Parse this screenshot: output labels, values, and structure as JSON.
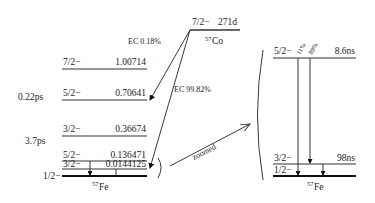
{
  "parent": {
    "spin": "7/2−",
    "halflife": "271d",
    "nucleus_mass": "57",
    "nucleus_symbol": "Co"
  },
  "decays": [
    {
      "label": "EC 0.18%",
      "to_level": "0.70641"
    },
    {
      "label": "EC 99.82%",
      "to_level": "0.136471"
    }
  ],
  "left_levels": [
    {
      "spin": "7/2−",
      "energy": "1.00714",
      "lifetime": ""
    },
    {
      "spin": "5/2−",
      "energy": "0.70641",
      "lifetime": "0.22ps"
    },
    {
      "spin": "3/2−",
      "energy": "0.36674",
      "lifetime": "3.7ps"
    },
    {
      "spin": "5/2−",
      "energy": "0.136471",
      "lifetime": ""
    },
    {
      "spin": "3/2−",
      "energy": "0.0144125",
      "lifetime": ""
    },
    {
      "spin": "1/2−",
      "energy": "",
      "lifetime": ""
    }
  ],
  "left_daughter": {
    "nucleus_mass": "57",
    "nucleus_symbol": "Fe"
  },
  "zoom_label": "zoomed",
  "right_levels": [
    {
      "spin": "5/2−",
      "lifetime": "8.6ns"
    },
    {
      "spin": "3/2−",
      "lifetime": "98ns"
    },
    {
      "spin": "1/2−",
      "lifetime": ""
    }
  ],
  "right_branches": [
    {
      "label": "11%"
    },
    {
      "label": "89%"
    }
  ],
  "right_daughter": {
    "nucleus_mass": "57",
    "nucleus_symbol": "Fe"
  }
}
